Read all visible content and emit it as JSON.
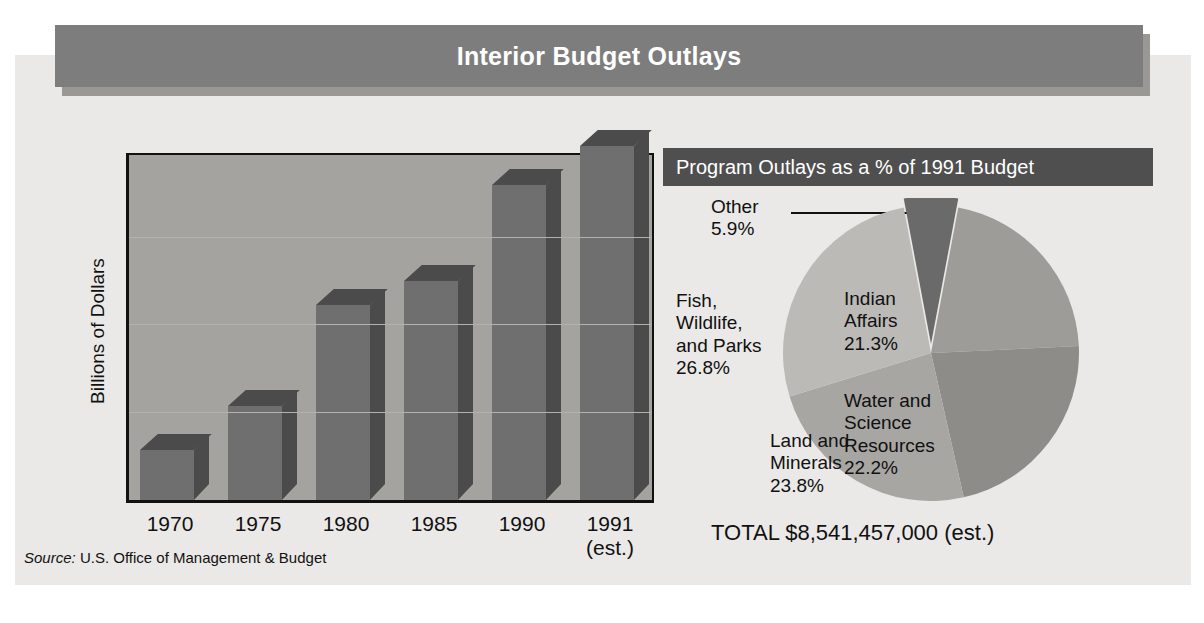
{
  "header": {
    "title": "Interior Budget Outlays"
  },
  "source": {
    "prefix": "Source:",
    "text": "U.S. Office of Management & Budget"
  },
  "pie_panel": {
    "subtitle": "Program Outlays as a % of 1991 Budget",
    "callout_label": "Other",
    "callout_value": "5.9%",
    "total": "TOTAL $8,541,457,000 (est.)"
  },
  "chart_data": [
    {
      "type": "bar",
      "title": "Interior Budget Outlays",
      "xlabel": "",
      "ylabel": "Billions of Dollars",
      "ylim": [
        0,
        8
      ],
      "yticks": [
        "0",
        "2",
        "4",
        "6",
        "8"
      ],
      "grid": true,
      "categories": [
        "1970",
        "1975",
        "1980",
        "1985",
        "1990",
        "1991\n(est.)"
      ],
      "category_labels": [
        {
          "line1": "1970",
          "line2": ""
        },
        {
          "line1": "1975",
          "line2": ""
        },
        {
          "line1": "1980",
          "line2": ""
        },
        {
          "line1": "1985",
          "line2": ""
        },
        {
          "line1": "1990",
          "line2": ""
        },
        {
          "line1": "1991",
          "line2": "(est.)"
        }
      ],
      "values": [
        1.15,
        2.15,
        4.45,
        5.0,
        7.2,
        8.1
      ],
      "colors": {
        "front": "#6f6f6f",
        "shade": "#4b4b4b",
        "plot_bg": "#a5a3a0"
      }
    },
    {
      "type": "pie",
      "title": "Program Outlays as a % of 1991 Budget",
      "labels": [
        "Other",
        "Indian Affairs",
        "Water and Science Resources",
        "Land and Minerals",
        "Fish, Wildlife, and Parks"
      ],
      "values": [
        5.9,
        21.3,
        22.2,
        23.8,
        26.8
      ],
      "value_labels": [
        "5.9%",
        "21.3%",
        "22.2%",
        "23.8%",
        "26.8%"
      ],
      "colors": [
        "#6a6a6a",
        "#9e9c99",
        "#8e8c89",
        "#a8a6a3",
        "#bcbab7"
      ],
      "exploded": [
        true,
        false,
        false,
        false,
        false
      ],
      "slice_text": [
        {
          "lines": [
            "Indian",
            "Affairs",
            "21.3%"
          ]
        },
        {
          "lines": [
            "Water and",
            "Science",
            "Resources",
            "22.2%"
          ]
        },
        {
          "lines": [
            "Land and",
            "Minerals",
            "23.8%"
          ]
        },
        {
          "lines": [
            "Fish,",
            "Wildlife,",
            "and Parks",
            "26.8%"
          ]
        }
      ],
      "total_label": "TOTAL $8,541,457,000 (est.)"
    }
  ]
}
